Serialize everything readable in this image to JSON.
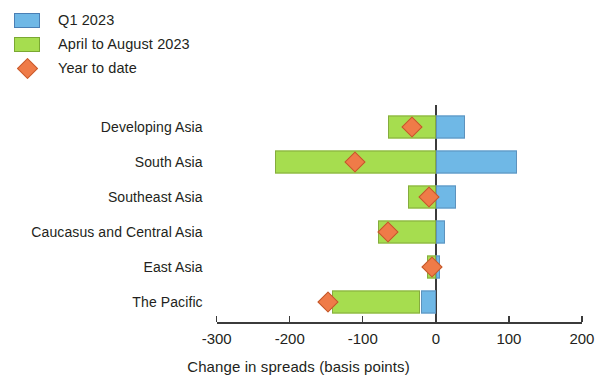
{
  "legend": {
    "items": [
      {
        "label": "Q1 2023",
        "type": "swatch",
        "color": "#6fb8e6",
        "icon": "blue-square-swatch"
      },
      {
        "label": "April to August 2023",
        "type": "swatch",
        "color": "#a6dd4f",
        "icon": "green-square-swatch"
      },
      {
        "label": "Year to date",
        "type": "marker",
        "color": "#ef7b48",
        "icon": "orange-diamond-marker"
      }
    ]
  },
  "axis": {
    "x_title": "Change in spreads (basis points)",
    "ticks": [
      "-300",
      "-200",
      "-100",
      "0",
      "100",
      "200"
    ]
  },
  "chart_data": {
    "type": "bar",
    "orientation": "horizontal",
    "title": "",
    "subtitle": "",
    "xlabel": "Change in spreads (basis points)",
    "ylabel": "",
    "xlim": [
      -300,
      200
    ],
    "xticks": [
      -300,
      -200,
      -100,
      0,
      100,
      200
    ],
    "grid": false,
    "legend_position": "top-left",
    "categories": [
      "Developing Asia",
      "South Asia",
      "Southeast Asia",
      "Caucasus and Central Asia",
      "East Asia",
      "The Pacific"
    ],
    "series": [
      {
        "name": "Q1 2023",
        "color": "#6fb8e6",
        "type": "floating_bar",
        "segments": [
          {
            "category": "Developing Asia",
            "start": 0,
            "end": 40
          },
          {
            "category": "South Asia",
            "start": 0,
            "end": 111
          },
          {
            "category": "Southeast Asia",
            "start": 0,
            "end": 28
          },
          {
            "category": "Caucasus and Central Asia",
            "start": 0,
            "end": 12
          },
          {
            "category": "East Asia",
            "start": 0,
            "end": 6
          },
          {
            "category": "The Pacific",
            "start": -21,
            "end": 0
          }
        ]
      },
      {
        "name": "April to August 2023",
        "color": "#a6dd4f",
        "type": "floating_bar",
        "segments": [
          {
            "category": "Developing Asia",
            "start": -65,
            "end": 0
          },
          {
            "category": "South Asia",
            "start": -220,
            "end": 0
          },
          {
            "category": "Southeast Asia",
            "start": -38,
            "end": 0
          },
          {
            "category": "Caucasus and Central Asia",
            "start": -79,
            "end": 0
          },
          {
            "category": "East Asia",
            "start": -12,
            "end": 0
          },
          {
            "category": "The Pacific",
            "start": -142,
            "end": -21
          }
        ]
      },
      {
        "name": "Year to date",
        "color": "#ef7b48",
        "type": "marker",
        "values": [
          -33,
          -110,
          -10,
          -66,
          -5,
          -148
        ]
      }
    ]
  }
}
